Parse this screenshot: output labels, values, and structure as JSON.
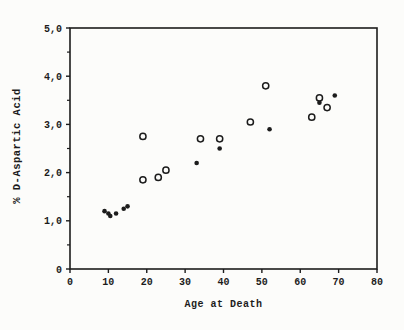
{
  "figure": {
    "background": "#fcfcfa",
    "ink_color": "#1c1c1c"
  },
  "chart_data": {
    "type": "scatter",
    "title": "",
    "xlabel": "Age at Death",
    "ylabel": "% D-Aspartic Acid",
    "xlim": [
      0,
      80
    ],
    "ylim": [
      0,
      5
    ],
    "grid": false,
    "legend": "none",
    "frame": "full-box",
    "x_ticks": [
      0,
      10,
      20,
      30,
      40,
      50,
      60,
      70,
      80
    ],
    "x_tick_labels": [
      "0",
      "10",
      "20",
      "30",
      "40",
      "50",
      "60",
      "70",
      "80"
    ],
    "y_major_ticks": [
      0,
      1,
      2,
      3,
      4,
      5
    ],
    "y_tick_labels": [
      "0",
      "1,0",
      "2,0",
      "3,0",
      "4,0",
      "5,0"
    ],
    "y_minor_ticks": [
      0.5,
      1.5,
      2.5,
      3.5,
      4.5
    ],
    "series": [
      {
        "name": "open-circle",
        "marker": "open-circle",
        "points": [
          [
            19,
            2.75
          ],
          [
            19,
            1.85
          ],
          [
            23,
            1.9
          ],
          [
            25,
            2.05
          ],
          [
            34,
            2.7
          ],
          [
            39,
            2.7
          ],
          [
            47,
            3.05
          ],
          [
            51,
            3.8
          ],
          [
            63,
            3.15
          ],
          [
            65,
            3.55
          ],
          [
            67,
            3.35
          ]
        ]
      },
      {
        "name": "filled-dot",
        "marker": "filled-dot",
        "points": [
          [
            9,
            1.2
          ],
          [
            10,
            1.15
          ],
          [
            10.5,
            1.1
          ],
          [
            12,
            1.15
          ],
          [
            14,
            1.25
          ],
          [
            15,
            1.3
          ],
          [
            33,
            2.2
          ],
          [
            39,
            2.5
          ],
          [
            52,
            2.9
          ],
          [
            65,
            3.45
          ],
          [
            69,
            3.6
          ]
        ]
      }
    ]
  }
}
